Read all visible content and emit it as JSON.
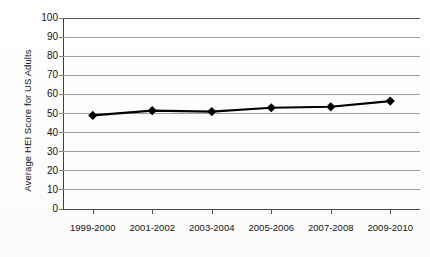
{
  "chart_data": {
    "type": "line",
    "title": "",
    "xlabel": "",
    "ylabel": "Average HEI Score for US Adults",
    "categories": [
      "1999-2000",
      "2001-2002",
      "2003-2004",
      "2005-2006",
      "2007-2008",
      "2009-2010"
    ],
    "values": [
      49,
      51.5,
      51,
      53,
      53.5,
      56.5
    ],
    "series": [
      {
        "name": "Average HEI Score for US Adults",
        "values": [
          49,
          51.5,
          51,
          53,
          53.5,
          56.5
        ]
      }
    ],
    "ylim": [
      0,
      100
    ],
    "ytick_labels": [
      "0",
      "10",
      "20",
      "30",
      "40",
      "50",
      "60",
      "70",
      "80",
      "90",
      "100"
    ],
    "ytick_values": [
      0,
      10,
      20,
      30,
      40,
      50,
      60,
      70,
      80,
      90,
      100
    ],
    "grid": true,
    "grid_axis": "y",
    "legend": false,
    "legend_position": "none",
    "marker": "diamond",
    "line_color": "#000000",
    "marker_color": "#000000",
    "gridline_color": "#9e9e9e",
    "axis_color": "#3d3d3d",
    "background_color": "#ffffff"
  }
}
